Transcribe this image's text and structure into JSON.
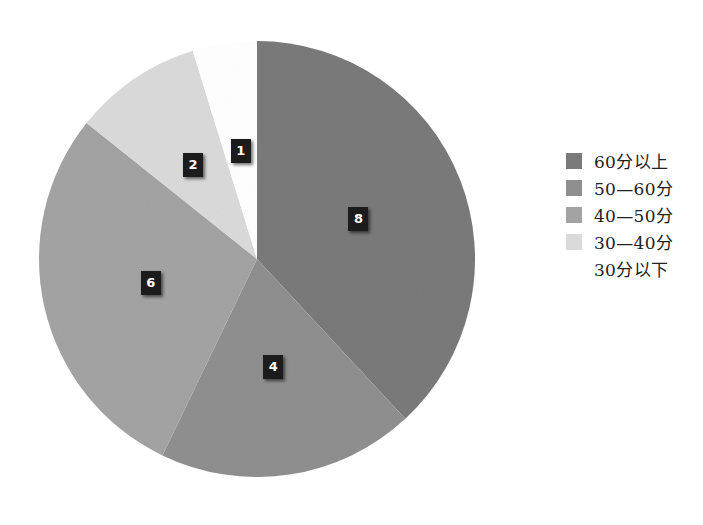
{
  "chart_data": {
    "type": "pie",
    "title": "",
    "categories": [
      "60分以上",
      "50—60分",
      "40—50分",
      "30—40分",
      "30分以下"
    ],
    "values": [
      8,
      4,
      6,
      2,
      1
    ],
    "colors": [
      "#7a7a7a",
      "#8f8f8f",
      "#a3a3a3",
      "#dadada",
      "#ffffff"
    ],
    "start_angle_deg": 0,
    "direction": "clockwise",
    "data_labels": [
      "8",
      "4",
      "6",
      "2",
      "1"
    ],
    "legend_position": "right",
    "legend": [
      "60分以上",
      "50—60分",
      "40—50分",
      "30—40分",
      "30分以下"
    ]
  },
  "geometry": {
    "cx": 257,
    "cy": 259,
    "r": 218
  }
}
